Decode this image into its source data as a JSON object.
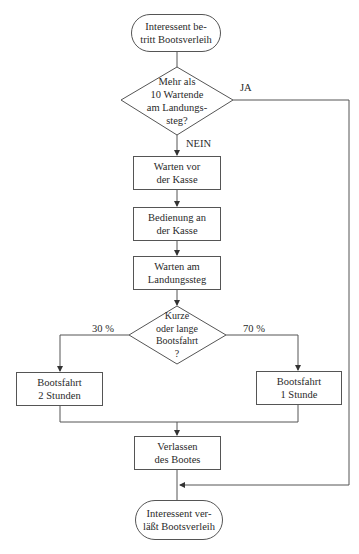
{
  "flowchart": {
    "start": {
      "label": "Interessent be-\ntritt Bootsverleih"
    },
    "decision_queue": {
      "label": "Mehr als\n10 Wartende\nam Landungs-\nsteg?",
      "yes_label": "JA",
      "no_label": "NEIN"
    },
    "step_wait_cashier": {
      "label": "Warten vor\nder Kasse"
    },
    "step_service_cashier": {
      "label": "Bedienung an\nder Kasse"
    },
    "step_wait_pier": {
      "label": "Warten am\nLandungssteg"
    },
    "decision_trip": {
      "label": "Kurze\noder lange\nBootsfahrt\n?",
      "left_label": "30 %",
      "right_label": "70 %"
    },
    "step_trip_long": {
      "label": "Bootsfahrt\n2 Stunden"
    },
    "step_trip_short": {
      "label": "Bootsfahrt\n1 Stunde"
    },
    "step_leave_boat": {
      "label": "Verlassen\ndes Bootes"
    },
    "end": {
      "label": "Interessent ver-\nläßt Bootsverleih"
    }
  },
  "colors": {
    "line": "#555555",
    "text": "#2a2a2a",
    "background": "#ffffff"
  }
}
